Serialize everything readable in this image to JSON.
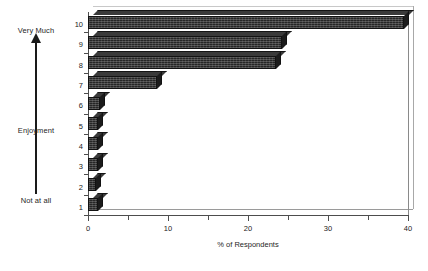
{
  "chart_data": {
    "type": "bar",
    "orientation": "horizontal",
    "title": "",
    "xlabel": "% of Respondents",
    "ylabel": "Enjoyment",
    "categories": [
      "1",
      "2",
      "3",
      "4",
      "5",
      "6",
      "7",
      "8",
      "9",
      "10"
    ],
    "values": [
      1.2,
      1.0,
      1.3,
      1.2,
      1.3,
      1.5,
      8.6,
      23.5,
      24.3,
      39.5
    ],
    "xlim": [
      0,
      40
    ],
    "xticks": [
      0,
      10,
      20,
      30,
      40
    ],
    "xtick_labels": [
      "0",
      "10",
      "20",
      "30",
      "40"
    ],
    "xminor_ticks": [
      5,
      15,
      25,
      35
    ],
    "grid": false,
    "legend": false,
    "bar_color": "#262626",
    "axis_color": "#4d4d4d",
    "scale_annotations": {
      "high_end": "Very Much",
      "low_end": "Not at all",
      "axis_name": "Enjoyment"
    }
  },
  "axes": {
    "y": {
      "label": "Enjoyment",
      "high_label": "Very Much",
      "low_label": "Not at all",
      "ticks": [
        "10",
        "9",
        "8",
        "7",
        "6",
        "5",
        "4",
        "3",
        "2",
        "1"
      ]
    },
    "x": {
      "title": "% of Respondents",
      "ticks": [
        "0",
        "10",
        "20",
        "30",
        "40"
      ]
    }
  },
  "icons": {
    "direction_arrow": "up-arrow-icon"
  }
}
